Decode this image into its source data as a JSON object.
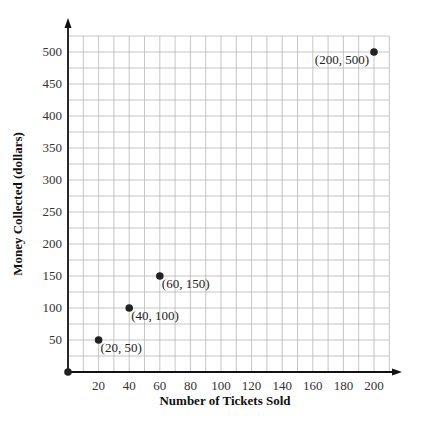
{
  "chart_data": {
    "type": "scatter",
    "title": "",
    "xlabel": "Number of Tickets Sold",
    "ylabel": "Money Collected (dollars)",
    "xlim": [
      0,
      210
    ],
    "ylim": [
      0,
      525
    ],
    "grid": true,
    "x_ticks": [
      20,
      40,
      60,
      80,
      100,
      120,
      140,
      160,
      180,
      200
    ],
    "y_ticks": [
      50,
      100,
      150,
      200,
      250,
      300,
      350,
      400,
      450,
      500
    ],
    "points": [
      {
        "x": 0,
        "y": 0,
        "label": ""
      },
      {
        "x": 20,
        "y": 50,
        "label": "(20, 50)"
      },
      {
        "x": 40,
        "y": 100,
        "label": "(40, 100)"
      },
      {
        "x": 60,
        "y": 150,
        "label": "(60, 150)"
      },
      {
        "x": 200,
        "y": 500,
        "label": "(200, 500)"
      }
    ],
    "colors": {
      "grid": "#b8b8b8",
      "axis": "#111111",
      "point": "#222222"
    }
  }
}
